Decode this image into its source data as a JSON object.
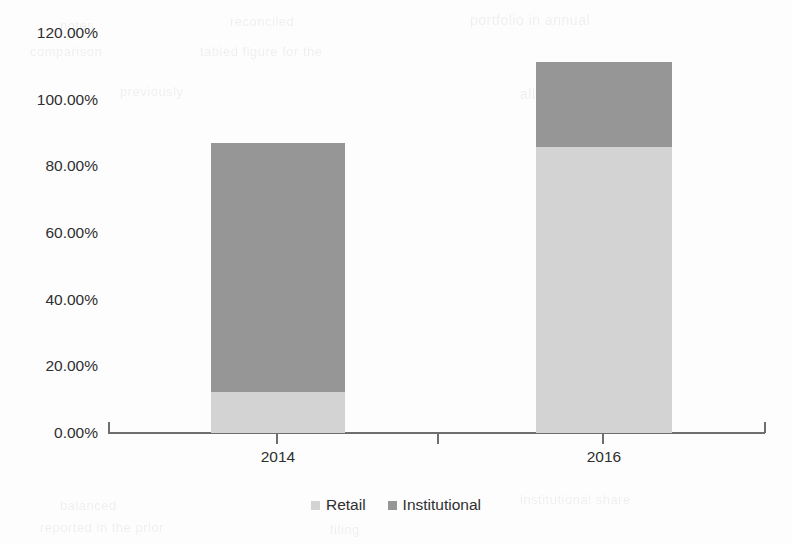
{
  "chart_data": {
    "type": "bar",
    "subtype": "stacked-column",
    "title": "",
    "subtitle": "",
    "xlabel": "",
    "ylabel": "",
    "categories": [
      "2014",
      "2016"
    ],
    "series": [
      {
        "name": "Retail",
        "color": "#d3d3d3",
        "values": [
          12.3,
          85.8
        ]
      },
      {
        "name": "Institutional",
        "color": "#969696",
        "values": [
          74.7,
          25.5
        ]
      }
    ],
    "totals": [
      87.0,
      111.3
    ],
    "value_format": "percent",
    "ylim": [
      0,
      120
    ],
    "y_ticks": [
      0,
      20,
      40,
      60,
      80,
      100,
      120
    ],
    "y_tick_labels": [
      "0.00%",
      "20.00%",
      "40.00%",
      "60.00%",
      "80.00%",
      "100.00%",
      "120.00%"
    ],
    "grid": false,
    "legend_position": "bottom",
    "legend_entries": [
      "Retail",
      "Institutional"
    ],
    "axis_color": "#6e6e6e",
    "background": "#fdfdfd"
  },
  "axis": {
    "y_labels": [
      "120.00%",
      "100.00%",
      "80.00%",
      "60.00%",
      "40.00%",
      "20.00%",
      "0.00%"
    ],
    "x_labels": [
      "2014",
      "2016"
    ]
  },
  "legend": {
    "items": [
      {
        "label": "Retail",
        "color": "#d3d3d3"
      },
      {
        "label": "Institutional",
        "color": "#969696"
      }
    ]
  },
  "ghost_text": [
    {
      "text": "notes",
      "x": 60,
      "y": 18,
      "size": 13
    },
    {
      "text": "reconciled",
      "x": 230,
      "y": 14,
      "size": 13
    },
    {
      "text": "portfolio in annual",
      "x": 470,
      "y": 12,
      "size": 14
    },
    {
      "text": "comparison",
      "x": 30,
      "y": 44,
      "size": 13
    },
    {
      "text": "tabled figure for the",
      "x": 200,
      "y": 44,
      "size": 13
    },
    {
      "text": "previously",
      "x": 120,
      "y": 84,
      "size": 13
    },
    {
      "text": "allocation ratio",
      "x": 520,
      "y": 86,
      "size": 14
    },
    {
      "text": "balanced",
      "x": 60,
      "y": 498,
      "size": 13
    },
    {
      "text": "institutional share",
      "x": 520,
      "y": 492,
      "size": 13
    },
    {
      "text": "reported in the prior",
      "x": 40,
      "y": 520,
      "size": 13
    },
    {
      "text": "filing",
      "x": 330,
      "y": 522,
      "size": 13
    }
  ]
}
